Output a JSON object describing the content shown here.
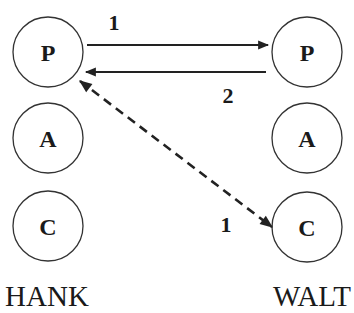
{
  "actors": [
    {
      "name": "HANK",
      "nodes": [
        "P",
        "A",
        "C"
      ]
    },
    {
      "name": "WALT",
      "nodes": [
        "P",
        "A",
        "C"
      ]
    }
  ],
  "edges": [
    {
      "from": "HANK.P",
      "to": "WALT.P",
      "label": "1",
      "style": "solid"
    },
    {
      "from": "WALT.P",
      "to": "HANK.P",
      "label": "2",
      "style": "solid"
    },
    {
      "from": "WALT.C",
      "to": "HANK.P",
      "label": "1",
      "style": "dashed",
      "bidirectional": true
    }
  ],
  "colors": {
    "stroke": "#333333",
    "text": "#1a1a1a",
    "background": "#ffffff"
  }
}
